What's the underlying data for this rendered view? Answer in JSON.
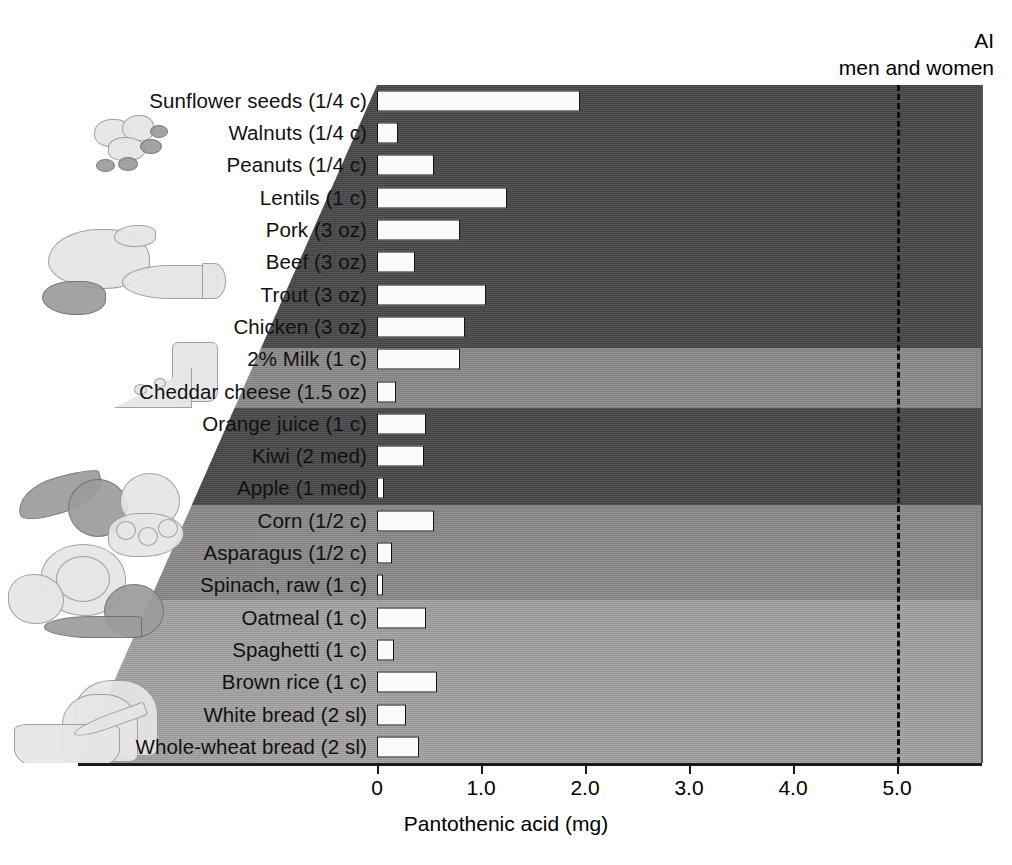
{
  "annotation": {
    "line1": "AI",
    "line2": "men and women",
    "value": 5.0
  },
  "axis": {
    "title": "Pantothenic acid (mg)",
    "ticks": [
      "0",
      "1.0",
      "2.0",
      "3.0",
      "4.0",
      "5.0"
    ],
    "min": 0,
    "max": 5.0
  },
  "groups": [
    {
      "name": "nuts-legumes",
      "shade": "dark",
      "count": 4
    },
    {
      "name": "meats-fish",
      "shade": "dark",
      "count": 4
    },
    {
      "name": "dairy",
      "shade": "medium",
      "count": 2
    },
    {
      "name": "fruits",
      "shade": "dark",
      "count": 3
    },
    {
      "name": "vegetables",
      "shade": "medium",
      "count": 3
    },
    {
      "name": "grains",
      "shade": "light",
      "count": 5
    }
  ],
  "chart_data": {
    "type": "bar",
    "orientation": "horizontal",
    "title": "",
    "xlabel": "Pantothenic acid (mg)",
    "ylabel": "",
    "xlim": [
      0,
      5.0
    ],
    "xticks": [
      0,
      1.0,
      2.0,
      3.0,
      4.0,
      5.0
    ],
    "grid": false,
    "legend": false,
    "reference_line": {
      "label": "AI men and women",
      "value": 5.0,
      "style": "dashed"
    },
    "categories": [
      "Sunflower seeds (1/4 c)",
      "Walnuts (1/4 c)",
      "Peanuts (1/4 c)",
      "Lentils (1 c)",
      "Pork (3 oz)",
      "Beef (3 oz)",
      "Trout (3 oz)",
      "Chicken (3 oz)",
      "2% Milk (1 c)",
      "Cheddar cheese (1.5 oz)",
      "Orange juice (1 c)",
      "Kiwi (2 med)",
      "Apple (1 med)",
      "Corn (1/2 c)",
      "Asparagus (1/2 c)",
      "Spinach, raw (1 c)",
      "Oatmeal (1 c)",
      "Spaghetti (1 c)",
      "Brown rice (1 c)",
      "White bread (2 sl)",
      "Whole-wheat bread (2 sl)"
    ],
    "values": [
      1.95,
      0.2,
      0.55,
      1.25,
      0.8,
      0.37,
      1.05,
      0.85,
      0.8,
      0.18,
      0.47,
      0.45,
      0.07,
      0.55,
      0.14,
      0.03,
      0.47,
      0.16,
      0.58,
      0.28,
      0.4
    ],
    "band_shades": [
      "dark",
      "dark",
      "dark",
      "dark",
      "dark",
      "dark",
      "dark",
      "dark",
      "medium",
      "medium",
      "dark",
      "dark",
      "dark",
      "medium",
      "medium",
      "medium",
      "light",
      "light",
      "light",
      "light",
      "light"
    ]
  },
  "colors": {
    "band_dark": "#484848",
    "band_medium": "#8a8a8a",
    "band_light": "#a2a2a2",
    "bar_fill": "#fbfbfb",
    "bar_stroke": "#121212",
    "axis": "#1a1a1a"
  }
}
